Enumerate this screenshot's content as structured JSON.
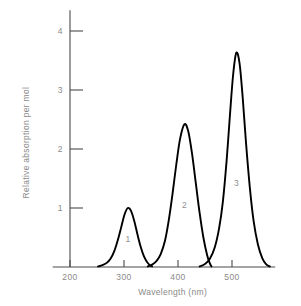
{
  "chart_data": {
    "type": "line",
    "title": "",
    "xlabel": "Wavelength (nm)",
    "ylabel": "Relative absorption per mol",
    "xlim": [
      168,
      580
    ],
    "ylim": [
      0,
      4.35
    ],
    "xticks": [
      200,
      300,
      400,
      500
    ],
    "xtick_labels": [
      "200",
      "300",
      "400",
      "500"
    ],
    "yticks": [
      1,
      2,
      3,
      4
    ],
    "ytick_labels": [
      "1",
      "2",
      "3",
      "4"
    ],
    "grid": false,
    "legend": "none",
    "annotations": [
      {
        "text": "1",
        "x": 307,
        "y": 0.43
      },
      {
        "text": "2",
        "x": 412,
        "y": 1.0
      },
      {
        "text": "3",
        "x": 508,
        "y": 1.37
      }
    ],
    "series": [
      {
        "name": "1",
        "peak_wavelength": 307,
        "peak_value": 1.0,
        "width_nm": 26,
        "x_start": 252,
        "x_end": 352,
        "points": [
          [
            252,
            0.01
          ],
          [
            260,
            0.03
          ],
          [
            268,
            0.07
          ],
          [
            275,
            0.14
          ],
          [
            282,
            0.27
          ],
          [
            289,
            0.47
          ],
          [
            295,
            0.68
          ],
          [
            301,
            0.89
          ],
          [
            307,
            1.0
          ],
          [
            313,
            0.95
          ],
          [
            319,
            0.78
          ],
          [
            325,
            0.55
          ],
          [
            331,
            0.34
          ],
          [
            337,
            0.18
          ],
          [
            343,
            0.08
          ],
          [
            348,
            0.03
          ],
          [
            352,
            0.01
          ]
        ]
      },
      {
        "name": "2",
        "peak_wavelength": 412,
        "peak_value": 2.42,
        "width_nm": 26,
        "x_start": 344,
        "x_end": 462,
        "points": [
          [
            344,
            0.01
          ],
          [
            352,
            0.04
          ],
          [
            360,
            0.1
          ],
          [
            368,
            0.22
          ],
          [
            376,
            0.45
          ],
          [
            383,
            0.8
          ],
          [
            390,
            1.25
          ],
          [
            397,
            1.75
          ],
          [
            404,
            2.18
          ],
          [
            412,
            2.42
          ],
          [
            419,
            2.3
          ],
          [
            426,
            1.92
          ],
          [
            433,
            1.42
          ],
          [
            440,
            0.92
          ],
          [
            447,
            0.5
          ],
          [
            454,
            0.2
          ],
          [
            459,
            0.06
          ],
          [
            462,
            0.01
          ]
        ]
      },
      {
        "name": "3",
        "peak_wavelength": 508,
        "peak_value": 3.63,
        "width_nm": 24,
        "x_start": 440,
        "x_end": 570,
        "points": [
          [
            440,
            0.01
          ],
          [
            450,
            0.05
          ],
          [
            459,
            0.14
          ],
          [
            468,
            0.33
          ],
          [
            476,
            0.65
          ],
          [
            483,
            1.1
          ],
          [
            490,
            1.8
          ],
          [
            496,
            2.55
          ],
          [
            502,
            3.25
          ],
          [
            508,
            3.63
          ],
          [
            514,
            3.45
          ],
          [
            520,
            2.85
          ],
          [
            526,
            2.1
          ],
          [
            533,
            1.35
          ],
          [
            540,
            0.78
          ],
          [
            548,
            0.38
          ],
          [
            556,
            0.15
          ],
          [
            563,
            0.05
          ],
          [
            570,
            0.01
          ]
        ]
      }
    ]
  }
}
